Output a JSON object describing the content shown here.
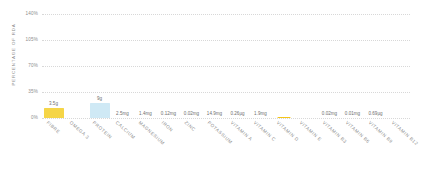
{
  "chart_data": {
    "type": "bar",
    "title": "",
    "xlabel": "",
    "ylabel": "PERCENTAGE OF RDA",
    "ylim": [
      0,
      140
    ],
    "yticks": [
      "0%",
      "35%",
      "70%",
      "105%",
      "140%"
    ],
    "ytick_values": [
      0,
      35,
      70,
      105,
      140
    ],
    "grid": true,
    "legend": "none",
    "categories": [
      "FIBRE",
      "OMEGA 3",
      "PROTEIN",
      "CALCIUM",
      "MAGNESIUM",
      "IRON",
      "ZINC",
      "POTASSIUM",
      "VITAMIN A",
      "VITAMIN C",
      "VITAMIN D",
      "VITAMIN E",
      "VITAMIN B3",
      "VITAMIN B6",
      "VITAMIN B9",
      "VITAMIN B12"
    ],
    "values": [
      14,
      0,
      20,
      0,
      0,
      0,
      0,
      0,
      0,
      0,
      2,
      0,
      0,
      0,
      0,
      0
    ],
    "amount_labels": [
      "3.5g",
      "",
      "9g",
      "2.5mg",
      "1.4mg",
      "0.12mg",
      "0.02mg",
      "14.9mg",
      "0.26µg",
      "1.9mg",
      "",
      "",
      "0.02mg",
      "0.01mg",
      "0.69µg",
      ""
    ],
    "bar_colors": [
      "#f5d547",
      "none",
      "#cfe9f5",
      "none",
      "none",
      "none",
      "none",
      "none",
      "none",
      "none",
      "#f5c518",
      "none",
      "none",
      "none",
      "none",
      "none"
    ]
  },
  "axis": {
    "y_title": "PERCENTAGE OF RDA"
  },
  "colors": {
    "fibre_bar": "#f5d547",
    "protein_bar": "#cfe9f5",
    "vitamin_d_marker": "#f5c518",
    "gridline": "#d8d8d8",
    "tick_text": "#8d8d8d",
    "label_text": "#8a8a8a",
    "value_text": "#6d6d6d",
    "background": "#ffffff"
  }
}
